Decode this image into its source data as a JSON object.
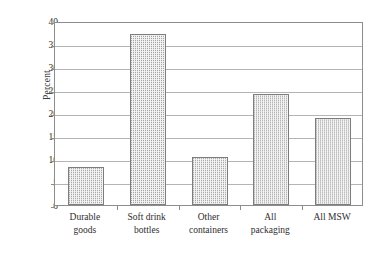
{
  "chart_data": {
    "type": "bar",
    "title": "",
    "xlabel": "",
    "ylabel": "Percent",
    "categories": [
      "Durable goods",
      "Soft drink bottles",
      "Other containers",
      "All packaging",
      "All MSW"
    ],
    "category_lines": [
      [
        "Durable",
        "goods"
      ],
      [
        "Soft drink",
        "bottles"
      ],
      [
        "Other",
        "containers"
      ],
      [
        "All",
        "packaging"
      ],
      [
        "All MSW"
      ]
    ],
    "values": [
      8.3,
      37.2,
      10.4,
      24.2,
      19.0
    ],
    "ylim": [
      0,
      40
    ],
    "ytick_labels": [
      "40",
      "35",
      "30",
      "25",
      "20",
      "15",
      "10",
      "5",
      "0"
    ],
    "ytick_values": [
      40,
      35,
      30,
      25,
      20,
      15,
      10,
      5,
      0
    ],
    "grid": "horizontal",
    "legend": "none",
    "bar_fill": "#f3f3f3",
    "bar_dot_color": "#9a9a9a",
    "bar_border": "#7d7d7d",
    "axis_color": "#8d8d8d",
    "grid_color": "#b4b4b4",
    "text_color": "#2e2e2e",
    "background": "#ffffff"
  }
}
